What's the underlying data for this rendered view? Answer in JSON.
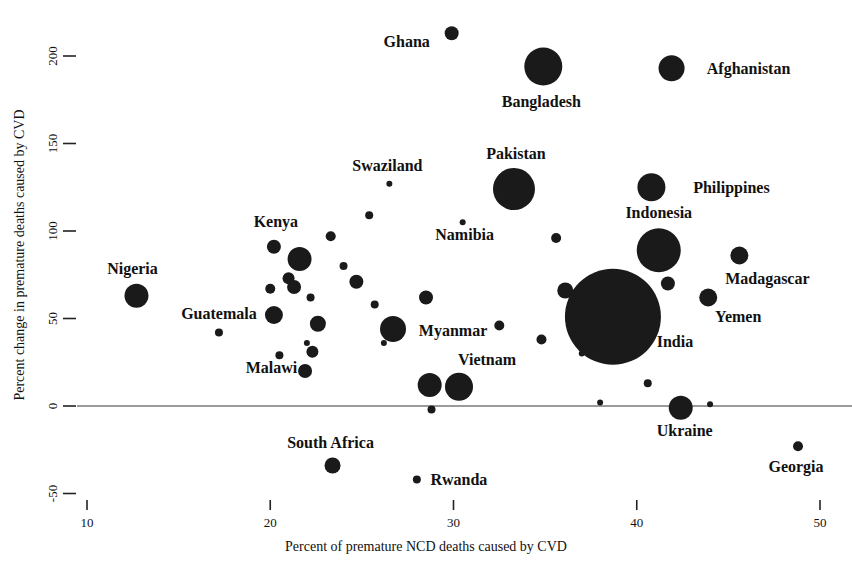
{
  "chart_data": {
    "type": "scatter",
    "title": "",
    "xlabel": "Percent of premature NCD deaths caused by CVD",
    "ylabel": "Percent change in premature deaths caused by CVD",
    "xlim": [
      8.0,
      51.5
    ],
    "ylim": [
      -62,
      218
    ],
    "xticks": [
      10,
      20,
      30,
      40,
      50
    ],
    "xtick_labels": [
      "10",
      "20",
      "30",
      "40",
      "50"
    ],
    "yticks": [
      -50,
      0,
      50,
      100,
      150,
      200
    ],
    "ytick_labels": [
      "-50",
      "0",
      "50",
      "100",
      "150",
      "200"
    ],
    "grid": false,
    "legend": "none",
    "zero_reference_line": 0,
    "size_encoding": "bubble area proportional to number of premature CVD deaths",
    "points": [
      {
        "label": "Ghana",
        "x": 29.9,
        "y": 213,
        "r": 7,
        "label_dx": -45,
        "label_dy": 14
      },
      {
        "label": "Bangladesh",
        "x": 34.9,
        "y": 194,
        "r": 19,
        "label_dx": -2,
        "label_dy": 40
      },
      {
        "label": "Afghanistan",
        "x": 41.9,
        "y": 193,
        "r": 13,
        "label_dx": 77,
        "label_dy": 6
      },
      {
        "label": "Pakistan",
        "x": 33.3,
        "y": 124,
        "r": 21,
        "label_dx": 2,
        "label_dy": -30
      },
      {
        "label": "Philippines",
        "x": 40.8,
        "y": 125,
        "r": 14,
        "label_dx": 80,
        "label_dy": 6
      },
      {
        "label": "Swaziland",
        "x": 26.5,
        "y": 127,
        "r": 3,
        "label_dx": -2,
        "label_dy": -13
      },
      {
        "label": "Indonesia",
        "x": 41.2,
        "y": 89,
        "r": 22,
        "label_dx": 0,
        "label_dy": -32
      },
      {
        "label": "Namibia",
        "x": 30.5,
        "y": 105,
        "r": 3,
        "label_dx": 2,
        "label_dy": 18
      },
      {
        "label": "Madagascar",
        "x": 45.6,
        "y": 86,
        "r": 9,
        "label_dx": 28,
        "label_dy": 28
      },
      {
        "label": "Kenya",
        "x": 20.2,
        "y": 91,
        "r": 7,
        "label_dx": 2,
        "label_dy": -20
      },
      {
        "label": "Nigeria",
        "x": 12.7,
        "y": 63,
        "r": 12,
        "label_dx": -4,
        "label_dy": -22
      },
      {
        "label": "India",
        "x": 38.7,
        "y": 51,
        "r": 48,
        "label_dx": 62,
        "label_dy": 30
      },
      {
        "label": "Yemen",
        "x": 43.9,
        "y": 62,
        "r": 9,
        "label_dx": 30,
        "label_dy": 24
      },
      {
        "label": "Guatemala",
        "x": 17.2,
        "y": 42,
        "r": 4,
        "label_dx": 0,
        "label_dy": -14
      },
      {
        "label": "Myanmar",
        "x": 26.7,
        "y": 44,
        "r": 13,
        "label_dx": 60,
        "label_dy": 7
      },
      {
        "label": "Malawi",
        "x": 20.5,
        "y": 29,
        "r": 4,
        "label_dx": -8,
        "label_dy": 18
      },
      {
        "label": "Vietnam",
        "x": 30.3,
        "y": 11,
        "r": 14,
        "label_dx": 28,
        "label_dy": -22
      },
      {
        "label": "Ukraine",
        "x": 42.4,
        "y": -1,
        "r": 12,
        "label_dx": 4,
        "label_dy": 28
      },
      {
        "label": "South Africa",
        "x": 23.4,
        "y": -34,
        "r": 8,
        "label_dx": -2,
        "label_dy": -18
      },
      {
        "label": "Rwanda",
        "x": 28.0,
        "y": -42,
        "r": 4,
        "label_dx": 42,
        "label_dy": 5
      },
      {
        "label": "Georgia",
        "x": 48.8,
        "y": -23,
        "r": 5,
        "label_dx": -2,
        "label_dy": 26
      }
    ],
    "unlabeled_points": [
      {
        "x": 21.6,
        "y": 84,
        "r": 12
      },
      {
        "x": 21.0,
        "y": 73,
        "r": 6
      },
      {
        "x": 21.3,
        "y": 68,
        "r": 7
      },
      {
        "x": 23.3,
        "y": 97,
        "r": 5
      },
      {
        "x": 24.0,
        "y": 80,
        "r": 4
      },
      {
        "x": 24.7,
        "y": 71,
        "r": 7
      },
      {
        "x": 22.2,
        "y": 62,
        "r": 4
      },
      {
        "x": 20.0,
        "y": 67,
        "r": 5
      },
      {
        "x": 20.2,
        "y": 52,
        "r": 9
      },
      {
        "x": 22.6,
        "y": 47,
        "r": 8
      },
      {
        "x": 22.0,
        "y": 36,
        "r": 3
      },
      {
        "x": 22.3,
        "y": 31,
        "r": 6
      },
      {
        "x": 21.9,
        "y": 20,
        "r": 7
      },
      {
        "x": 25.4,
        "y": 109,
        "r": 4
      },
      {
        "x": 25.7,
        "y": 58,
        "r": 4
      },
      {
        "x": 26.2,
        "y": 36,
        "r": 3
      },
      {
        "x": 28.5,
        "y": 62,
        "r": 7
      },
      {
        "x": 28.7,
        "y": 12,
        "r": 12
      },
      {
        "x": 28.8,
        "y": -2,
        "r": 4
      },
      {
        "x": 32.5,
        "y": 46,
        "r": 5
      },
      {
        "x": 35.6,
        "y": 96,
        "r": 5
      },
      {
        "x": 36.1,
        "y": 66,
        "r": 8
      },
      {
        "x": 34.8,
        "y": 38,
        "r": 5
      },
      {
        "x": 37.0,
        "y": 30,
        "r": 3
      },
      {
        "x": 38.0,
        "y": 2,
        "r": 3
      },
      {
        "x": 40.6,
        "y": 13,
        "r": 4
      },
      {
        "x": 41.7,
        "y": 70,
        "r": 7
      },
      {
        "x": 44.0,
        "y": 1,
        "r": 3
      }
    ]
  }
}
